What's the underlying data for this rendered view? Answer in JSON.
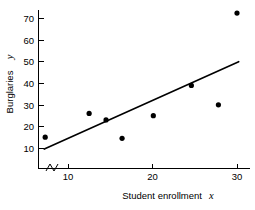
{
  "chart_data": {
    "type": "scatter",
    "title": "",
    "xlabel": "Student enrollment",
    "xlabel_var": "x",
    "ylabel": "Burglaries",
    "ylabel_var": "y",
    "xlim": [
      6.6,
      31.2
    ],
    "ylim": [
      5.5,
      75.5
    ],
    "xticks": [
      10,
      20,
      30
    ],
    "xtick_labels": [
      "10",
      "20",
      "30"
    ],
    "yticks": [
      10,
      20,
      30,
      40,
      50,
      60,
      70
    ],
    "ytick_labels": [
      "10",
      "20",
      "30",
      "40",
      "50",
      "60",
      "70"
    ],
    "grid": false,
    "legend": null,
    "axis_break_x": true,
    "axis_break_y": true,
    "points": [
      {
        "x": 7.3,
        "y": 15
      },
      {
        "x": 12.5,
        "y": 26
      },
      {
        "x": 14.5,
        "y": 23
      },
      {
        "x": 16.4,
        "y": 14.5
      },
      {
        "x": 20.1,
        "y": 25
      },
      {
        "x": 24.6,
        "y": 39
      },
      {
        "x": 27.8,
        "y": 30
      },
      {
        "x": 30.0,
        "y": 72.5
      }
    ],
    "fit_line": {
      "x1": 7.2,
      "y1": 9.5,
      "x2": 30.2,
      "y2": 50.0
    }
  },
  "colors": {
    "axis": "#000000",
    "point": "#000000",
    "line": "#000000",
    "background": "#ffffff"
  }
}
